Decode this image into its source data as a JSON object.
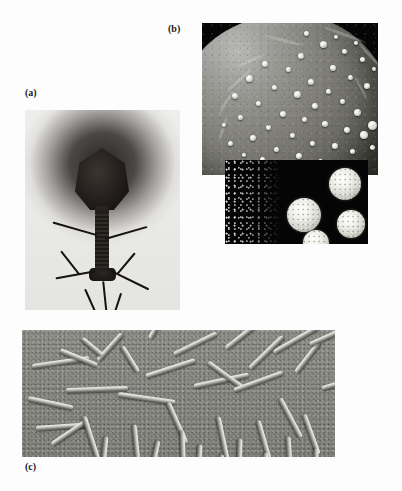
{
  "figure": {
    "background_color": "#fdfdfd",
    "width": 402,
    "height": 491,
    "type": "scanned-textbook-figure",
    "ghost_header_text": "",
    "ghost_body_text": ""
  },
  "panels": [
    {
      "id": "a",
      "label": "(a)",
      "caption_text": "(a)",
      "content": "bacteriophage transmission electron micrograph",
      "imaging_mode": "TEM negative stain",
      "tone": "grayscale",
      "background_color": "#e8e8e6",
      "subject_color": "#1a1614",
      "position": {
        "left": 25,
        "top": 110,
        "width": 155,
        "height": 200
      },
      "features": [
        "icosahedral head",
        "collar",
        "contractile tail sheath",
        "base plate",
        "tail fibers"
      ],
      "tail_fiber_count": 5
    },
    {
      "id": "b",
      "label": "(b)",
      "caption_text": "(b)",
      "content": "virions budding from a host cell surface",
      "imaging_mode": "SEM",
      "tone": "grayscale",
      "background_color": "#060606",
      "subject_color": "#f0f0ea",
      "position": {
        "left": 202,
        "top": 23,
        "width": 176,
        "height": 152
      },
      "features": [
        "spherical cell",
        "surface ridges",
        "budding spherical virions"
      ],
      "virion_count": 46
    },
    {
      "id": "b2",
      "label": "",
      "caption_text": "",
      "content": "isolated spherical virions on dark background",
      "imaging_mode": "dark-field electron micrograph",
      "tone": "grayscale high contrast",
      "background_color": "#050505",
      "subject_color": "#f0f0ea",
      "position": {
        "left": 225,
        "top": 160,
        "width": 143,
        "height": 84
      },
      "features": [
        "four bright spherical virions",
        "speckled debris field"
      ],
      "virion_count": 4
    },
    {
      "id": "c",
      "label": "(c)",
      "caption_text": "(c)",
      "content": "rod-shaped (helical) viruses, tobacco mosaic virus type",
      "imaging_mode": "TEM shadow-cast",
      "tone": "grayscale",
      "background_color": "#8a8a85",
      "subject_color": "#e8e8e2",
      "position": {
        "left": 22,
        "top": 330,
        "width": 313,
        "height": 127
      },
      "features": [
        "rigid rods",
        "random orientation",
        "shadow cast"
      ],
      "rod_count": 38
    }
  ],
  "panel_a_fibers": [
    {
      "left": 72,
      "top": 124,
      "len": 46,
      "rot": 196,
      "w": 2.2
    },
    {
      "left": 80,
      "top": 128,
      "len": 44,
      "rot": -16,
      "w": 2.2
    },
    {
      "left": 70,
      "top": 160,
      "len": 40,
      "rot": 170,
      "w": 2.4
    },
    {
      "left": 86,
      "top": 160,
      "len": 42,
      "rot": 26,
      "w": 2.4
    },
    {
      "left": 78,
      "top": 170,
      "len": 36,
      "rot": 84,
      "w": 2.4
    },
    {
      "left": 36,
      "top": 140,
      "len": 30,
      "rot": 52,
      "w": 2.0
    },
    {
      "left": 110,
      "top": 142,
      "len": 28,
      "rot": 130,
      "w": 2.0
    },
    {
      "left": 60,
      "top": 178,
      "len": 26,
      "rot": 66,
      "w": 2.2
    },
    {
      "left": 96,
      "top": 182,
      "len": 24,
      "rot": 108,
      "w": 2.2
    }
  ],
  "panel_b_virions": [
    {
      "x": 118,
      "y": 18,
      "d": 7
    },
    {
      "x": 96,
      "y": 30,
      "d": 6
    },
    {
      "x": 140,
      "y": 26,
      "d": 5
    },
    {
      "x": 60,
      "y": 38,
      "d": 6
    },
    {
      "x": 84,
      "y": 44,
      "d": 5
    },
    {
      "x": 128,
      "y": 42,
      "d": 6
    },
    {
      "x": 158,
      "y": 34,
      "d": 5
    },
    {
      "x": 44,
      "y": 52,
      "d": 7
    },
    {
      "x": 106,
      "y": 56,
      "d": 6
    },
    {
      "x": 146,
      "y": 52,
      "d": 5
    },
    {
      "x": 70,
      "y": 62,
      "d": 5
    },
    {
      "x": 92,
      "y": 68,
      "d": 7
    },
    {
      "x": 124,
      "y": 66,
      "d": 5
    },
    {
      "x": 162,
      "y": 60,
      "d": 6
    },
    {
      "x": 30,
      "y": 70,
      "d": 6
    },
    {
      "x": 54,
      "y": 78,
      "d": 5
    },
    {
      "x": 110,
      "y": 80,
      "d": 6
    },
    {
      "x": 138,
      "y": 76,
      "d": 5
    },
    {
      "x": 78,
      "y": 88,
      "d": 6
    },
    {
      "x": 100,
      "y": 94,
      "d": 5
    },
    {
      "x": 152,
      "y": 86,
      "d": 7
    },
    {
      "x": 36,
      "y": 92,
      "d": 5
    },
    {
      "x": 120,
      "y": 98,
      "d": 6
    },
    {
      "x": 64,
      "y": 102,
      "d": 5
    },
    {
      "x": 142,
      "y": 104,
      "d": 6
    },
    {
      "x": 88,
      "y": 110,
      "d": 5
    },
    {
      "x": 166,
      "y": 98,
      "d": 9
    },
    {
      "x": 158,
      "y": 108,
      "d": 8
    },
    {
      "x": 48,
      "y": 112,
      "d": 6
    },
    {
      "x": 108,
      "y": 118,
      "d": 5
    },
    {
      "x": 130,
      "y": 120,
      "d": 6
    },
    {
      "x": 72,
      "y": 124,
      "d": 5
    },
    {
      "x": 94,
      "y": 130,
      "d": 6
    },
    {
      "x": 148,
      "y": 126,
      "d": 5
    },
    {
      "x": 26,
      "y": 118,
      "d": 5
    },
    {
      "x": 116,
      "y": 136,
      "d": 5
    },
    {
      "x": 58,
      "y": 134,
      "d": 5
    },
    {
      "x": 136,
      "y": 140,
      "d": 4
    },
    {
      "x": 80,
      "y": 142,
      "d": 4
    },
    {
      "x": 40,
      "y": 130,
      "d": 4
    },
    {
      "x": 168,
      "y": 122,
      "d": 5
    },
    {
      "x": 102,
      "y": 8,
      "d": 5
    },
    {
      "x": 132,
      "y": 12,
      "d": 4
    },
    {
      "x": 152,
      "y": 18,
      "d": 4
    },
    {
      "x": 170,
      "y": 44,
      "d": 4
    },
    {
      "x": 20,
      "y": 100,
      "d": 4
    }
  ],
  "panel_b_ridges": [
    {
      "x": 20,
      "y": 56,
      "w": 34,
      "h": 3,
      "r": -42
    },
    {
      "x": 10,
      "y": 78,
      "w": 28,
      "h": 3,
      "r": -58
    },
    {
      "x": 62,
      "y": 16,
      "w": 40,
      "h": 3,
      "r": 14
    },
    {
      "x": 120,
      "y": 10,
      "w": 44,
      "h": 3,
      "r": 20
    },
    {
      "x": 152,
      "y": 30,
      "w": 30,
      "h": 3,
      "r": 48
    },
    {
      "x": 8,
      "y": 104,
      "w": 26,
      "h": 3,
      "r": -72
    },
    {
      "x": 34,
      "y": 36,
      "w": 30,
      "h": 3,
      "r": -24
    },
    {
      "x": 146,
      "y": 64,
      "w": 26,
      "h": 2,
      "r": 62
    }
  ],
  "panel_b2_virions": [
    {
      "x": 62,
      "y": 38,
      "d": 34
    },
    {
      "x": 104,
      "y": 8,
      "d": 32
    },
    {
      "x": 112,
      "y": 50,
      "d": 28
    },
    {
      "x": 78,
      "y": 70,
      "d": 26
    }
  ],
  "panel_c_rods": [
    {
      "x": 10,
      "y": 34,
      "len": 58,
      "rot": -8
    },
    {
      "x": 6,
      "y": 66,
      "len": 46,
      "rot": 12
    },
    {
      "x": 14,
      "y": 96,
      "len": 54,
      "rot": -4
    },
    {
      "x": 38,
      "y": 18,
      "len": 40,
      "rot": 22
    },
    {
      "x": 44,
      "y": 58,
      "len": 62,
      "rot": -2
    },
    {
      "x": 30,
      "y": 112,
      "len": 44,
      "rot": -34
    },
    {
      "x": 62,
      "y": 84,
      "len": 50,
      "rot": 72
    },
    {
      "x": 76,
      "y": 28,
      "len": 36,
      "rot": -48
    },
    {
      "x": 84,
      "y": 104,
      "len": 40,
      "rot": 96
    },
    {
      "x": 96,
      "y": 62,
      "len": 58,
      "rot": 8
    },
    {
      "x": 100,
      "y": 14,
      "len": 30,
      "rot": 58
    },
    {
      "x": 112,
      "y": 92,
      "len": 46,
      "rot": 84
    },
    {
      "x": 124,
      "y": 44,
      "len": 52,
      "rot": -18
    },
    {
      "x": 136,
      "y": 108,
      "len": 38,
      "rot": 102
    },
    {
      "x": 146,
      "y": 70,
      "len": 44,
      "rot": 66
    },
    {
      "x": 152,
      "y": 22,
      "len": 48,
      "rot": -26
    },
    {
      "x": 160,
      "y": 98,
      "len": 34,
      "rot": 88
    },
    {
      "x": 172,
      "y": 54,
      "len": 56,
      "rot": -12
    },
    {
      "x": 178,
      "y": 112,
      "len": 30,
      "rot": 94
    },
    {
      "x": 186,
      "y": 30,
      "len": 42,
      "rot": 36
    },
    {
      "x": 196,
      "y": 84,
      "len": 48,
      "rot": 78
    },
    {
      "x": 204,
      "y": 16,
      "len": 38,
      "rot": -38
    },
    {
      "x": 212,
      "y": 58,
      "len": 52,
      "rot": -20
    },
    {
      "x": 218,
      "y": 106,
      "len": 32,
      "rot": 92
    },
    {
      "x": 228,
      "y": 36,
      "len": 46,
      "rot": -44
    },
    {
      "x": 236,
      "y": 88,
      "len": 40,
      "rot": 74
    },
    {
      "x": 244,
      "y": 120,
      "len": 28,
      "rot": 98
    },
    {
      "x": 252,
      "y": 20,
      "len": 54,
      "rot": -30
    },
    {
      "x": 258,
      "y": 66,
      "len": 44,
      "rot": 62
    },
    {
      "x": 266,
      "y": 104,
      "len": 36,
      "rot": 86
    },
    {
      "x": 274,
      "y": 40,
      "len": 38,
      "rot": -52
    },
    {
      "x": 282,
      "y": 82,
      "len": 42,
      "rot": 70
    },
    {
      "x": 288,
      "y": 12,
      "len": 34,
      "rot": -24
    },
    {
      "x": 294,
      "y": 116,
      "len": 30,
      "rot": 90
    },
    {
      "x": 300,
      "y": 56,
      "len": 36,
      "rot": -16
    },
    {
      "x": 60,
      "y": 6,
      "len": 26,
      "rot": 40
    },
    {
      "x": 128,
      "y": 6,
      "len": 24,
      "rot": -60
    },
    {
      "x": 200,
      "y": 122,
      "len": 26,
      "rot": 100
    }
  ]
}
